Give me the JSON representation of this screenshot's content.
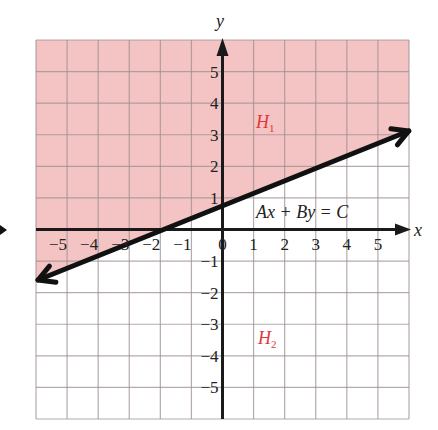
{
  "chart_data": {
    "type": "line",
    "title": "",
    "xlabel": "x",
    "ylabel": "y",
    "xlim": [
      -6,
      6
    ],
    "ylim": [
      -6,
      6
    ],
    "grid": true,
    "x_ticks": [
      -5,
      -4,
      -3,
      -2,
      -1,
      0,
      1,
      2,
      3,
      4,
      5
    ],
    "y_ticks": [
      5,
      4,
      3,
      2,
      1,
      -1,
      -2,
      -3,
      -4,
      -5
    ],
    "series": [
      {
        "name": "Ax + By = C",
        "kind": "line",
        "points": [
          [
            -6,
            -1.6
          ],
          [
            -2,
            0
          ],
          [
            0,
            0.8
          ],
          [
            5.8,
            3.12
          ]
        ],
        "slope": 0.4,
        "intercept": 0.8
      }
    ],
    "regions": [
      {
        "name": "H1",
        "label": "H",
        "subscript": "1",
        "side": "above",
        "fill": "#f4c3c3"
      },
      {
        "name": "H2",
        "label": "H",
        "subscript": "2",
        "side": "below",
        "fill": "#ffffff"
      }
    ],
    "annotations": [
      {
        "text": "Ax + By = C",
        "x": 1.1,
        "y": 0.3
      },
      {
        "text": "H1",
        "x": 1.1,
        "y": 2.8
      },
      {
        "text": "H2",
        "x": 1.1,
        "y": -3.5
      }
    ]
  },
  "labels": {
    "x_axis": "x",
    "y_axis": "y",
    "equation": "Ax + By = C",
    "region1_main": "H",
    "region1_sub": "1",
    "region2_main": "H",
    "region2_sub": "2",
    "origin": "0"
  },
  "colors": {
    "shade": "#f4c3c3",
    "grid": "#9e8f8f",
    "grid_light": "#b8b8b8",
    "axis": "#1a1a1a",
    "region_label": "#e0383a"
  }
}
